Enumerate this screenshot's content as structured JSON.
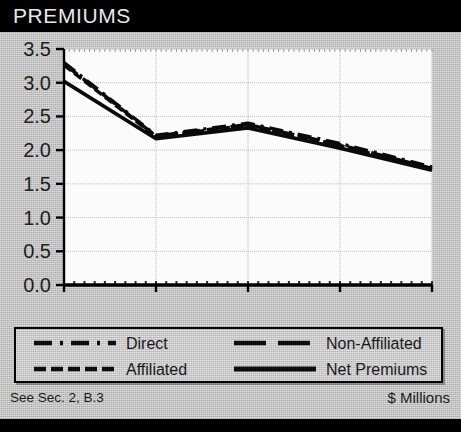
{
  "header": {
    "title": "PREMIUMS"
  },
  "footer": {
    "source_note": "See Sec. 2, B.3",
    "units": "$ Millions"
  },
  "colors": {
    "titlebar_bg": "#000000",
    "titlebar_text": "#e8e8e8",
    "panel_bg": "#bdbdbd",
    "plot_bg": "#fbfbfb",
    "grid": "#b0b0b0",
    "axis": "#000000",
    "series": "#000000"
  },
  "legend": {
    "position": "below-plot",
    "entries": [
      {
        "label": "Direct",
        "style": "dash-dot",
        "sample": "dashdot",
        "column": 0,
        "row": 0
      },
      {
        "label": "Non-Affiliated",
        "style": "long-dash",
        "sample": "longdash",
        "column": 1,
        "row": 0
      },
      {
        "label": "Affiliated",
        "style": "short-dash",
        "sample": "shortdash",
        "column": 0,
        "row": 1
      },
      {
        "label": "Net Premiums",
        "style": "solid",
        "sample": "solid",
        "column": 1,
        "row": 1
      }
    ]
  },
  "chart_data": {
    "type": "line",
    "title": "PREMIUMS",
    "xlabel": "",
    "ylabel": "",
    "units": "$ Millions",
    "grid": true,
    "legend_position": "bottom",
    "x": [
      2003,
      2004,
      2005,
      2006,
      2007
    ],
    "xlim": [
      2003,
      2007
    ],
    "ylim": [
      0.0,
      3.5
    ],
    "xticks": [
      2003,
      2004,
      2005,
      2006,
      2007
    ],
    "xticklabels": [
      "2003",
      "",
      "2005",
      "",
      "2007"
    ],
    "yticks": [
      0.0,
      0.5,
      1.0,
      1.5,
      2.0,
      2.5,
      3.0,
      3.5
    ],
    "yticklabels": [
      "0.0",
      "0.5",
      "1.0",
      "1.5",
      "2.0",
      "2.5",
      "3.0",
      "3.5"
    ],
    "series": [
      {
        "name": "Direct",
        "style": "dash-dot",
        "values": [
          3.3,
          2.22,
          2.4,
          2.1,
          1.75
        ]
      },
      {
        "name": "Non-Affiliated",
        "style": "long-dash",
        "values": [
          3.28,
          2.21,
          2.38,
          2.08,
          1.73
        ]
      },
      {
        "name": "Affiliated",
        "style": "short-dash",
        "values": [
          3.26,
          2.2,
          2.37,
          2.07,
          1.72
        ]
      },
      {
        "name": "Net Premiums",
        "style": "solid",
        "values": [
          3.02,
          2.17,
          2.33,
          2.03,
          1.7
        ]
      }
    ]
  }
}
